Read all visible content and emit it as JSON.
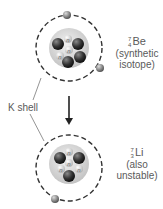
{
  "diagram": {
    "top_atom": {
      "mass_number": "7",
      "atomic_number": "4",
      "symbol": "Be",
      "note_line1": "(synthetic",
      "note_line2": "isotope)",
      "protons": 4,
      "neutrons": 3,
      "electrons": 2
    },
    "bottom_atom": {
      "mass_number": "7",
      "atomic_number": "3",
      "symbol": "Li",
      "note_line1": "(also",
      "note_line2": "unstable)",
      "protons": 3,
      "neutrons": 4,
      "electrons": 1
    },
    "shell_label": "K shell",
    "neutron_glyph": "n",
    "proton_glyph": "+",
    "colors": {
      "nucleus_bg": "#d8d8d8",
      "proton": "#3a3a3a",
      "neutron": "#c8c8c8",
      "shell": "#333333",
      "electron": "#777777"
    }
  }
}
